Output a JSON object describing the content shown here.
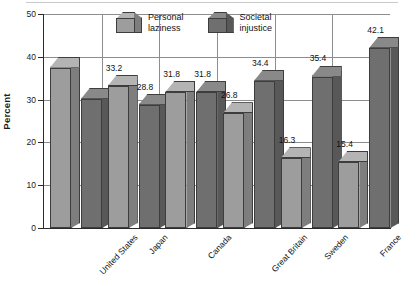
{
  "chart_data": {
    "type": "bar",
    "title": "",
    "subtitle": "",
    "xlabel": "",
    "ylabel": "Percent",
    "ylim": [
      0,
      50
    ],
    "yticks": [
      0,
      10,
      20,
      30,
      40,
      50
    ],
    "ytick_labels": [
      "0",
      "10",
      "20",
      "30",
      "40",
      "50"
    ],
    "grid": "horizontal-and-vertical",
    "legend_position": "top-center",
    "style": "3d-bars-grayscale",
    "categories": [
      "United States",
      "Japan",
      "Canada",
      "Great Britain",
      "Sweden",
      "France"
    ],
    "series": [
      {
        "name": "Personal laziness",
        "color": "#9d9d9d",
        "values": [
          37.5,
          33.2,
          31.8,
          26.8,
          16.3,
          15.4
        ],
        "labels": [
          "",
          "33.2",
          "31.8",
          "26.8",
          "16.3",
          "15.4"
        ]
      },
      {
        "name": "Societal injustice",
        "color": "#6f6f6f",
        "values": [
          30.2,
          28.8,
          31.8,
          34.4,
          35.4,
          42.1
        ],
        "labels": [
          "",
          "28.8",
          "31.8",
          "34.4",
          "35.4",
          "42.1"
        ]
      }
    ]
  },
  "axis": {
    "y_title": "Percent"
  },
  "legend": {
    "items": [
      {
        "label_line1": "Personal",
        "label_line2": "laziness",
        "swatch": "light-gray-cube-icon"
      },
      {
        "label_line1": "Societal",
        "label_line2": "injustice",
        "swatch": "dark-gray-cube-icon"
      }
    ]
  }
}
